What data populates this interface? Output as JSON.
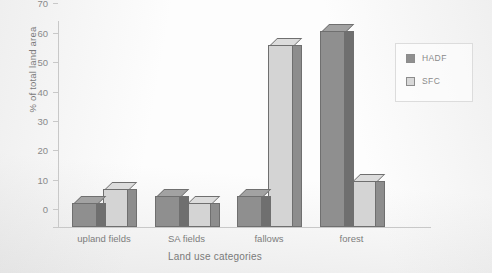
{
  "chart_data": {
    "type": "bar",
    "title": "",
    "xlabel": "Land use categories",
    "ylabel": "% of total land area",
    "categories": [
      "upland fields",
      "SA fields",
      "fallows",
      "forest"
    ],
    "series": [
      {
        "name": "HADF",
        "color": "#8f8f8f",
        "values": [
          8,
          10.5,
          10.5,
          66.5
        ]
      },
      {
        "name": "SFC",
        "color": "#d4d4d4",
        "values": [
          13,
          8,
          62,
          15.5
        ]
      }
    ],
    "ylim": [
      0,
      70
    ],
    "yticks": [
      0,
      10,
      20,
      30,
      40,
      50,
      60,
      70
    ],
    "grid": false,
    "legend_position": "right",
    "style": "3d-bar"
  },
  "legend": {
    "entries": [
      {
        "label": "HADF"
      },
      {
        "label": "SFC"
      }
    ]
  }
}
